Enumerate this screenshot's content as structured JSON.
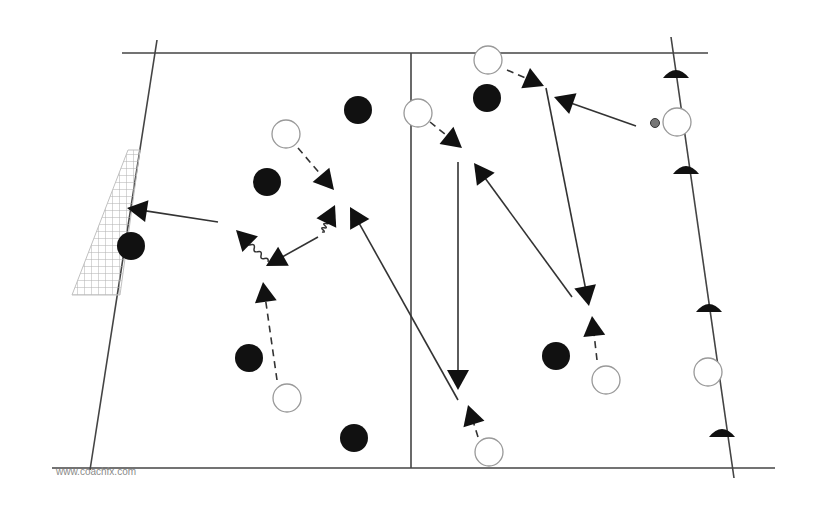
{
  "diagram": {
    "type": "soccer-drill",
    "watermark": "www.coachfx.com",
    "colors": {
      "line": "#444444",
      "attacker": "#ffffff",
      "defender": "#111111",
      "cone": "#111111",
      "net": "#b0b0b0"
    },
    "field": {
      "top_line": [
        [
          122,
          53
        ],
        [
          708,
          53
        ]
      ],
      "bottom_line": [
        [
          52,
          468
        ],
        [
          775,
          468
        ]
      ],
      "left_line": [
        [
          157,
          40
        ],
        [
          90,
          470
        ]
      ],
      "right_line": [
        [
          671,
          37
        ],
        [
          734,
          478
        ]
      ],
      "halfway_line": [
        [
          411,
          53
        ],
        [
          411,
          468
        ]
      ]
    },
    "goal": {
      "label": "net",
      "polygon": [
        [
          128,
          150
        ],
        [
          140,
          150
        ],
        [
          120,
          295
        ],
        [
          72,
          295
        ]
      ]
    },
    "defenders": [
      [
        358,
        110
      ],
      [
        487,
        98
      ],
      [
        267,
        182
      ],
      [
        131,
        246
      ],
      [
        249,
        358
      ],
      [
        556,
        356
      ],
      [
        354,
        438
      ]
    ],
    "attackers": [
      [
        488,
        60
      ],
      [
        418,
        113
      ],
      [
        286,
        134
      ],
      [
        677,
        122
      ],
      [
        287,
        398
      ],
      [
        606,
        380
      ],
      [
        489,
        452
      ],
      [
        708,
        372
      ]
    ],
    "ball": [
      655,
      123
    ],
    "cones": [
      [
        676,
        74
      ],
      [
        686,
        170
      ],
      [
        709,
        308
      ],
      [
        722,
        433
      ]
    ],
    "solid_arrows": [
      {
        "from": [
          218,
          222
        ],
        "to": [
          127,
          208
        ]
      },
      {
        "from": [
          318,
          237
        ],
        "to": [
          266,
          266
        ]
      },
      {
        "from": [
          458,
          400
        ],
        "to": [
          350,
          207
        ]
      },
      {
        "from": [
          458,
          162
        ],
        "to": [
          458,
          390
        ]
      },
      {
        "from": [
          572,
          297
        ],
        "to": [
          474,
          163
        ]
      },
      {
        "from": [
          636,
          126
        ],
        "to": [
          554,
          97
        ]
      },
      {
        "from": [
          546,
          88
        ],
        "to": [
          589,
          306
        ]
      }
    ],
    "dashed_arrows": [
      {
        "from": [
          298,
          148
        ],
        "to": [
          334,
          190
        ]
      },
      {
        "from": [
          277,
          380
        ],
        "to": [
          263,
          282
        ]
      },
      {
        "from": [
          507,
          70
        ],
        "to": [
          544,
          86
        ]
      },
      {
        "from": [
          430,
          122
        ],
        "to": [
          462,
          148
        ]
      },
      {
        "from": [
          478,
          437
        ],
        "to": [
          468,
          405
        ]
      },
      {
        "from": [
          597,
          360
        ],
        "to": [
          592,
          316
        ]
      }
    ],
    "dribble_paths": [
      {
        "from": [
          268,
          262
        ],
        "to": [
          236,
          230
        ]
      },
      {
        "from": [
          322,
          232
        ],
        "to": [
          335,
          205
        ]
      }
    ]
  }
}
